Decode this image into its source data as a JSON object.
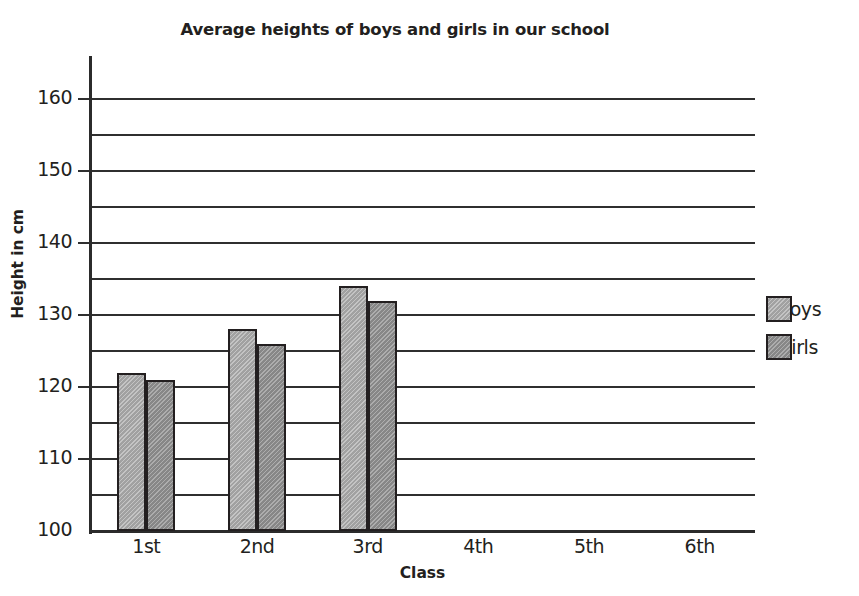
{
  "chart_data": {
    "type": "bar",
    "title": "Average heights of boys and girls in our school",
    "xlabel": "Class",
    "ylabel": "Height in cm",
    "categories": [
      "1st",
      "2nd",
      "3rd",
      "4th",
      "5th",
      "6th"
    ],
    "series": [
      {
        "name": "Boys",
        "color": "#ababab",
        "values": [
          122,
          128,
          134,
          null,
          null,
          null
        ]
      },
      {
        "name": "Girls",
        "color": "#919191",
        "values": [
          121,
          126,
          132,
          null,
          null,
          null
        ]
      }
    ],
    "ylim": [
      100,
      162
    ],
    "y_major_ticks": [
      100,
      110,
      120,
      130,
      140,
      150,
      160
    ],
    "y_minor_ticks": [
      105,
      115,
      125,
      135,
      145,
      155
    ],
    "grid": true,
    "legend_position": "right"
  },
  "legend": {
    "entries": [
      {
        "label": "Boys",
        "swatch": "boys-swatch"
      },
      {
        "label": "Girls",
        "swatch": "girls-swatch"
      }
    ]
  }
}
